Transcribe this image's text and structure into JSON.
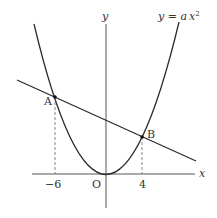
{
  "diagram": {
    "type": "function-graph",
    "curve_label": "y = a x²",
    "curve_label_parts": {
      "lhs": "y = ",
      "coef": "a",
      "var": "x",
      "exp": "2"
    },
    "axes": {
      "x_label": "x",
      "y_label": "y",
      "origin_label": "O"
    },
    "points": [
      {
        "label": "A",
        "x": -6
      },
      {
        "label": "B",
        "x": 4
      }
    ],
    "tick_labels": {
      "left": "−6",
      "right": "4"
    },
    "colors": {
      "stroke": "#2b2b2b",
      "axis": "#555555",
      "dashed": "#777777"
    }
  }
}
